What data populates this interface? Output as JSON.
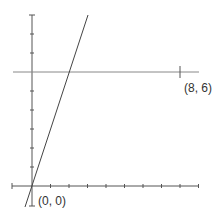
{
  "diagram": {
    "labels": {
      "origin": "(0, 0)",
      "point": "(8, 6)"
    },
    "colors": {
      "axis": "#555555",
      "line": "#444444",
      "guide": "#888888"
    },
    "elements": {
      "x_axis": {
        "from": [
          -1,
          0
        ],
        "to": [
          10,
          0
        ],
        "ticks": [
          1,
          2,
          3,
          4,
          5,
          6,
          7,
          8,
          9
        ]
      },
      "y_axis": {
        "from": [
          0,
          -0.5
        ],
        "to": [
          0,
          9
        ],
        "ticks": [
          1,
          2,
          3,
          4,
          5,
          6,
          7,
          8,
          9
        ]
      },
      "horizontal_line": {
        "y": 6,
        "from_x": -1,
        "to_x": 9,
        "tick_at_x": 8
      },
      "line": {
        "equation": "y = 3x",
        "from": [
          -0.3,
          -1
        ],
        "to": [
          3,
          9
        ]
      }
    }
  }
}
